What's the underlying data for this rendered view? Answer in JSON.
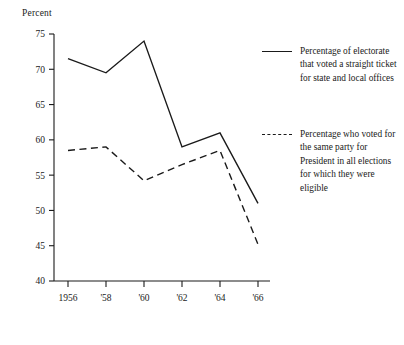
{
  "chart_data": {
    "type": "line",
    "title": "",
    "subtitle": "",
    "xlabel": "",
    "ylabel": "Percent",
    "categories": [
      "1956",
      "'58",
      "'60",
      "'62",
      "'64",
      "'66"
    ],
    "x_values": [
      1956,
      1958,
      1960,
      1962,
      1964,
      1966
    ],
    "xtick_labels": [
      "1956",
      "'58",
      "'60",
      "'62",
      "'64",
      "'66"
    ],
    "ytick_labels": [
      "40",
      "45",
      "50",
      "55",
      "60",
      "65",
      "70",
      "75"
    ],
    "ytick_values": [
      40,
      45,
      50,
      55,
      60,
      65,
      70,
      75
    ],
    "ylim": [
      40,
      75
    ],
    "grid": false,
    "legend_position": "right",
    "series": [
      {
        "name": "Percentage of electorate that voted a straight ticket for state and local offices",
        "style": "solid",
        "color": "#1a1a1a",
        "values": [
          71.5,
          69.5,
          74.0,
          59.0,
          61.0,
          51.0
        ]
      },
      {
        "name": "Percentage who voted for the same party for President in all elections for which they were eligible",
        "style": "dashed",
        "color": "#1a1a1a",
        "values": [
          58.5,
          59.0,
          54.2,
          56.5,
          58.5,
          45.2
        ]
      }
    ]
  },
  "axis": {
    "y_title": "Percent"
  },
  "legend": {
    "entries": [
      {
        "marker": "solid-line-swatch",
        "label": "Percentage of electorate that voted a straight ticket for state and local offices"
      },
      {
        "marker": "dashed-line-swatch",
        "label": "Percentage who voted for the same party for President in all elections for which they were eligible"
      }
    ]
  }
}
